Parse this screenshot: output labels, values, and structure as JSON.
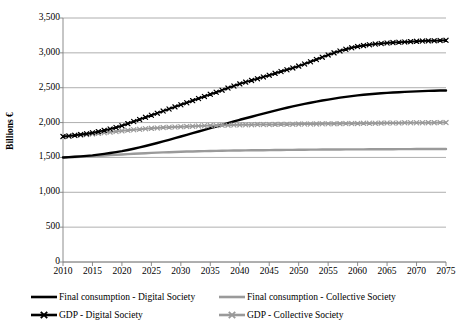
{
  "chart_data": {
    "type": "line",
    "title": "",
    "xlabel": "",
    "ylabel": "Billions €",
    "xlim": [
      2010,
      2075
    ],
    "ylim": [
      0,
      3500
    ],
    "grid": true,
    "legend_position": "bottom",
    "y_ticks": [
      "3,500",
      "3,000",
      "2,500",
      "2,000",
      "1,500",
      "1,000",
      "500",
      "0"
    ],
    "y_tick_values": [
      3500,
      3000,
      2500,
      2000,
      1500,
      1000,
      500,
      0
    ],
    "x_ticks": [
      "2010",
      "2015",
      "2020",
      "2025",
      "2030",
      "2035",
      "2040",
      "2045",
      "2050",
      "2055",
      "2060",
      "2065",
      "2070",
      "2075"
    ],
    "x": [
      2010,
      2011,
      2012,
      2013,
      2014,
      2015,
      2016,
      2017,
      2018,
      2019,
      2020,
      2021,
      2022,
      2023,
      2024,
      2025,
      2026,
      2027,
      2028,
      2029,
      2030,
      2031,
      2032,
      2033,
      2034,
      2035,
      2036,
      2037,
      2038,
      2039,
      2040,
      2041,
      2042,
      2043,
      2044,
      2045,
      2046,
      2047,
      2048,
      2049,
      2050,
      2051,
      2052,
      2053,
      2054,
      2055,
      2056,
      2057,
      2058,
      2059,
      2060,
      2061,
      2062,
      2063,
      2064,
      2065,
      2066,
      2067,
      2068,
      2069,
      2070,
      2071,
      2072,
      2073,
      2074,
      2075
    ],
    "series": [
      {
        "name": "GDP - Digital Society",
        "color": "#000000",
        "marker": "x",
        "width": 2.0,
        "values": [
          1800,
          1808,
          1818,
          1828,
          1840,
          1854,
          1870,
          1888,
          1908,
          1930,
          1955,
          1985,
          2015,
          2045,
          2075,
          2105,
          2135,
          2165,
          2195,
          2225,
          2255,
          2285,
          2315,
          2345,
          2375,
          2405,
          2435,
          2465,
          2495,
          2525,
          2555,
          2580,
          2605,
          2630,
          2655,
          2680,
          2706,
          2732,
          2758,
          2784,
          2810,
          2840,
          2872,
          2905,
          2938,
          2970,
          3000,
          3028,
          3052,
          3072,
          3090,
          3104,
          3116,
          3126,
          3134,
          3141,
          3147,
          3152,
          3157,
          3161,
          3165,
          3169,
          3172,
          3175,
          3178,
          3180
        ]
      },
      {
        "name": "GDP - Collective Society",
        "color": "#9a9a9a",
        "marker": "x",
        "width": 2.0,
        "values": [
          1800,
          1806,
          1813,
          1820,
          1828,
          1836,
          1845,
          1854,
          1863,
          1872,
          1881,
          1889,
          1897,
          1904,
          1911,
          1917,
          1923,
          1928,
          1933,
          1937,
          1941,
          1945,
          1948,
          1951,
          1954,
          1957,
          1959,
          1961,
          1963,
          1965,
          1967,
          1968,
          1970,
          1971,
          1972,
          1973,
          1974,
          1975,
          1976,
          1977,
          1978,
          1979,
          1980,
          1981,
          1982,
          1983,
          1984,
          1985,
          1986,
          1987,
          1988,
          1989,
          1990,
          1991,
          1992,
          1993,
          1994,
          1995,
          1996,
          1997,
          1998,
          1998,
          1999,
          1999,
          2000,
          2000
        ]
      },
      {
        "name": "Final consumption - Digital Society",
        "color": "#000000",
        "marker": "none",
        "width": 2.4,
        "values": [
          1500,
          1504,
          1509,
          1515,
          1522,
          1530,
          1540,
          1551,
          1563,
          1576,
          1590,
          1607,
          1625,
          1644,
          1664,
          1685,
          1707,
          1730,
          1753,
          1776,
          1800,
          1824,
          1848,
          1872,
          1896,
          1920,
          1944,
          1968,
          1992,
          2016,
          2040,
          2062,
          2084,
          2106,
          2128,
          2150,
          2172,
          2193,
          2213,
          2232,
          2250,
          2268,
          2285,
          2301,
          2316,
          2330,
          2344,
          2357,
          2369,
          2380,
          2390,
          2399,
          2407,
          2414,
          2420,
          2426,
          2431,
          2436,
          2440,
          2444,
          2448,
          2451,
          2454,
          2457,
          2459,
          2460
        ]
      },
      {
        "name": "Final consumption - Collective Society",
        "color": "#9a9a9a",
        "marker": "none",
        "width": 2.4,
        "values": [
          1500,
          1503,
          1506,
          1510,
          1514,
          1518,
          1523,
          1528,
          1533,
          1538,
          1543,
          1548,
          1553,
          1557,
          1561,
          1565,
          1569,
          1572,
          1575,
          1578,
          1581,
          1584,
          1586,
          1588,
          1590,
          1592,
          1594,
          1596,
          1598,
          1599,
          1600,
          1601,
          1602,
          1603,
          1604,
          1605,
          1606,
          1607,
          1608,
          1609,
          1610,
          1611,
          1612,
          1612,
          1613,
          1613,
          1614,
          1614,
          1615,
          1615,
          1616,
          1616,
          1617,
          1617,
          1618,
          1618,
          1618,
          1619,
          1619,
          1619,
          1620,
          1620,
          1620,
          1620,
          1620,
          1620
        ]
      }
    ]
  },
  "legend": {
    "items": [
      {
        "label": "Final consumption - Digital Society",
        "color": "#000000",
        "marker": "none"
      },
      {
        "label": "Final consumption - Collective Society",
        "color": "#9a9a9a",
        "marker": "none"
      },
      {
        "label": "GDP - Digital Society",
        "color": "#000000",
        "marker": "x"
      },
      {
        "label": "GDP - Collective Society",
        "color": "#9a9a9a",
        "marker": "x"
      }
    ]
  },
  "axes": {
    "y_title": "Billions €",
    "gridline_color": "#9a9a9a",
    "axis_color": "#808080"
  }
}
